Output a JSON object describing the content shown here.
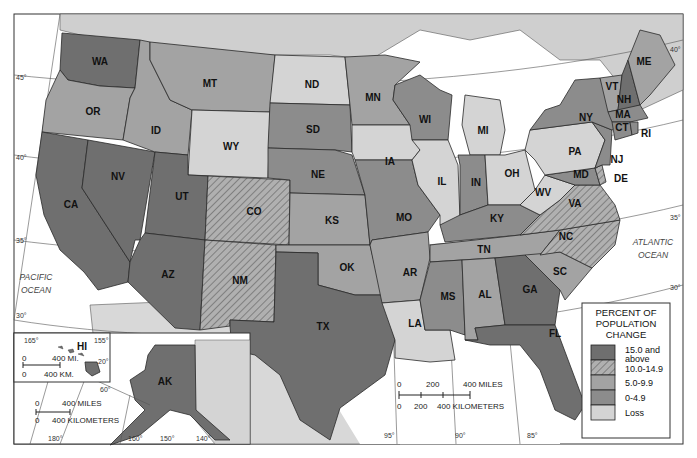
{
  "map": {
    "title": "Percent of Population Change by State",
    "oceans": [
      {
        "name": "PACIFIC",
        "line2": "OCEAN"
      },
      {
        "name": "ATLANTIC",
        "line2": "OCEAN"
      }
    ],
    "colors": {
      "c15": "#6f6f6f",
      "c10": "#a8a8a8",
      "c5": "#a3a3a3",
      "c0": "#8c8c8c",
      "loss": "#d4d4d4",
      "land_other": "#cfcfcf",
      "water": "#ffffff"
    },
    "states": [
      {
        "abbr": "WA",
        "class": "15.0 and above"
      },
      {
        "abbr": "OR",
        "class": "5.0-9.9"
      },
      {
        "abbr": "CA",
        "class": "15.0 and above"
      },
      {
        "abbr": "NV",
        "class": "15.0 and above"
      },
      {
        "abbr": "ID",
        "class": "5.0-9.9"
      },
      {
        "abbr": "MT",
        "class": "5.0-9.9"
      },
      {
        "abbr": "WY",
        "class": "Loss"
      },
      {
        "abbr": "UT",
        "class": "15.0 and above"
      },
      {
        "abbr": "AZ",
        "class": "15.0 and above"
      },
      {
        "abbr": "CO",
        "class": "10.0-14.9"
      },
      {
        "abbr": "NM",
        "class": "10.0-14.9"
      },
      {
        "abbr": "ND",
        "class": "Loss"
      },
      {
        "abbr": "SD",
        "class": "0-4.9"
      },
      {
        "abbr": "NE",
        "class": "0-4.9"
      },
      {
        "abbr": "KS",
        "class": "5.0-9.9"
      },
      {
        "abbr": "OK",
        "class": "5.0-9.9"
      },
      {
        "abbr": "TX",
        "class": "15.0 and above"
      },
      {
        "abbr": "MN",
        "class": "5.0-9.9"
      },
      {
        "abbr": "IA",
        "class": "Loss"
      },
      {
        "abbr": "MO",
        "class": "0-4.9"
      },
      {
        "abbr": "AR",
        "class": "5.0-9.9"
      },
      {
        "abbr": "LA",
        "class": "Loss"
      },
      {
        "abbr": "WI",
        "class": "0-4.9"
      },
      {
        "abbr": "IL",
        "class": "Loss"
      },
      {
        "abbr": "MI",
        "class": "Loss"
      },
      {
        "abbr": "IN",
        "class": "0-4.9"
      },
      {
        "abbr": "OH",
        "class": "Loss"
      },
      {
        "abbr": "KY",
        "class": "0-4.9"
      },
      {
        "abbr": "TN",
        "class": "5.0-9.9"
      },
      {
        "abbr": "MS",
        "class": "0-4.9"
      },
      {
        "abbr": "AL",
        "class": "5.0-9.9"
      },
      {
        "abbr": "GA",
        "class": "15.0 and above"
      },
      {
        "abbr": "FL",
        "class": "15.0 and above"
      },
      {
        "abbr": "SC",
        "class": "5.0-9.9"
      },
      {
        "abbr": "NC",
        "class": "10.0-14.9"
      },
      {
        "abbr": "VA",
        "class": "10.0-14.9"
      },
      {
        "abbr": "WV",
        "class": "Loss"
      },
      {
        "abbr": "PA",
        "class": "Loss"
      },
      {
        "abbr": "NY",
        "class": "0-4.9"
      },
      {
        "abbr": "NJ",
        "class": "0-4.9"
      },
      {
        "abbr": "DE",
        "class": "10.0-14.9"
      },
      {
        "abbr": "MD",
        "class": "0-4.9"
      },
      {
        "abbr": "VT",
        "class": "5.0-9.9"
      },
      {
        "abbr": "NH",
        "class": "15.0 and above"
      },
      {
        "abbr": "ME",
        "class": "5.0-9.9"
      },
      {
        "abbr": "MA",
        "class": "0-4.9"
      },
      {
        "abbr": "CT",
        "class": "0-4.9"
      },
      {
        "abbr": "RI",
        "class": "0-4.9"
      },
      {
        "abbr": "AK",
        "class": "15.0 and above"
      },
      {
        "abbr": "HI",
        "class": "15.0 and above"
      }
    ],
    "graticule_labels": {
      "lat": [
        "45°",
        "40°",
        "35°",
        "30°"
      ],
      "lat_east": [
        "40°",
        "35°",
        "30°"
      ],
      "lon_bottom": [
        "95°",
        "90°",
        "85°"
      ],
      "ak_lon": [
        "180°",
        "160°",
        "150°",
        "140°"
      ],
      "ak_lat": "60°",
      "hi_lon": [
        "165°",
        "155°"
      ],
      "hi_lat": "20°"
    },
    "scale_main": {
      "miles": [
        "0",
        "200",
        "400 MILES"
      ],
      "km": [
        "0",
        "200",
        "400 KILOMETERS"
      ]
    },
    "scale_ak": {
      "miles": [
        "0",
        "400 MILES"
      ],
      "km": [
        "0",
        "400 KILOMETERS"
      ]
    },
    "scale_hi": {
      "miles": [
        "0",
        "400 MI."
      ],
      "km": [
        "0",
        "400 KM."
      ]
    }
  },
  "legend": {
    "title_lines": [
      "PERCENT OF",
      "POPULATION",
      "CHANGE"
    ],
    "items": [
      {
        "label_lines": [
          "15.0 and",
          "above"
        ],
        "color": "#6f6f6f",
        "hatch": false
      },
      {
        "label_lines": [
          "10.0-14.9"
        ],
        "color": "#a8a8a8",
        "hatch": true
      },
      {
        "label_lines": [
          "5.0-9.9"
        ],
        "color": "#a3a3a3",
        "hatch": false
      },
      {
        "label_lines": [
          "0-4.9"
        ],
        "color": "#8c8c8c",
        "hatch": false
      },
      {
        "label_lines": [
          "Loss"
        ],
        "color": "#d4d4d4",
        "hatch": false
      }
    ]
  }
}
